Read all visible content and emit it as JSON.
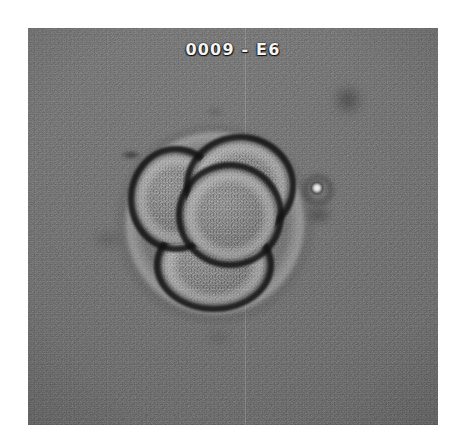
{
  "page": {
    "background_color": "#ffffff",
    "width": 457,
    "height": 442
  },
  "micrograph": {
    "label": "0009 - E6",
    "label_color": "#f4f4f4",
    "frame": {
      "x": 28,
      "y": 28,
      "width": 410,
      "height": 397
    },
    "background_color": "#727272",
    "modality": "phase-contrast light microscopy",
    "subject": "four-cell embryo",
    "specimen": {
      "id": "0009",
      "well": "E6",
      "cell_count": 4,
      "structures": [
        {
          "name": "zona-pellucida",
          "description": "faint bright halo ring enclosing the blastomeres"
        },
        {
          "name": "blastomere-upper-left",
          "description": "upper-left cell with dark refractive rim"
        },
        {
          "name": "blastomere-upper-right",
          "description": "upper-right cell with dark refractive rim"
        },
        {
          "name": "blastomere-center",
          "description": "central granular cell, brightest cytoplasm"
        },
        {
          "name": "blastomere-lower",
          "description": "lower cell with dark refractive rim"
        }
      ],
      "artifacts": [
        {
          "name": "debris-dark-top-right",
          "description": "out-of-focus dark particle upper right"
        },
        {
          "name": "debris-bright-right",
          "description": "small bright refractile fragment right of embryo"
        },
        {
          "name": "debris-dark-left",
          "description": "small dark speck left of embryo"
        },
        {
          "name": "scan-seam",
          "description": "faint vertical seam line down the frame"
        }
      ]
    }
  }
}
